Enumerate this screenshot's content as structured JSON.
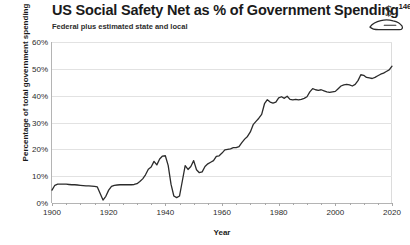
{
  "header": {
    "title": "US Social Safety Net as % of Government Spending",
    "title_superscript": "146",
    "subtitle": "Federal plus estimated state and local",
    "icon": "hand-holding-dollar-icon"
  },
  "colors": {
    "line": "#2b2b2b",
    "gridline": "#e2e2e2",
    "axis": "#b4b4b4",
    "text": "#1a1a1a",
    "background": "#ffffff"
  },
  "chart_data": {
    "type": "line",
    "title": "US Social Safety Net as % of Government Spending",
    "subtitle": "Federal plus estimated state and local",
    "xlabel": "Year",
    "ylabel": "Percentage of total government spending",
    "xlim": [
      1900,
      2020
    ],
    "ylim": [
      0,
      60
    ],
    "y_tick_labels": [
      "0%",
      "10%",
      "20%",
      "30%",
      "40%",
      "50%",
      "60%"
    ],
    "y_ticks": [
      0,
      10,
      20,
      30,
      40,
      50,
      60
    ],
    "x_tick_labels": [
      "1900",
      "1920",
      "1940",
      "1960",
      "1980",
      "2000",
      "2020"
    ],
    "x_ticks": [
      1900,
      1920,
      1940,
      1960,
      1980,
      2000,
      2020
    ],
    "x_minor_tick_step": 5,
    "grid": "horizontal",
    "legend": "none",
    "series": [
      {
        "name": "Social safety net share of government spending",
        "x": [
          1900,
          1901,
          1902,
          1903,
          1904,
          1905,
          1906,
          1907,
          1908,
          1909,
          1910,
          1911,
          1912,
          1913,
          1914,
          1915,
          1916,
          1917,
          1918,
          1919,
          1920,
          1921,
          1922,
          1923,
          1924,
          1925,
          1926,
          1927,
          1928,
          1929,
          1930,
          1931,
          1932,
          1933,
          1934,
          1935,
          1936,
          1937,
          1938,
          1939,
          1940,
          1941,
          1942,
          1943,
          1944,
          1945,
          1946,
          1947,
          1948,
          1949,
          1950,
          1951,
          1952,
          1953,
          1954,
          1955,
          1956,
          1957,
          1958,
          1959,
          1960,
          1961,
          1962,
          1963,
          1964,
          1965,
          1966,
          1967,
          1968,
          1969,
          1970,
          1971,
          1972,
          1973,
          1974,
          1975,
          1976,
          1977,
          1978,
          1979,
          1980,
          1981,
          1982,
          1983,
          1984,
          1985,
          1986,
          1987,
          1988,
          1989,
          1990,
          1991,
          1992,
          1993,
          1994,
          1995,
          1996,
          1997,
          1998,
          1999,
          2000,
          2001,
          2002,
          2003,
          2004,
          2005,
          2006,
          2007,
          2008,
          2009,
          2010,
          2011,
          2012,
          2013,
          2014,
          2015,
          2016,
          2017,
          2018,
          2019,
          2020
        ],
        "y": [
          4.8,
          6.6,
          7.0,
          7.0,
          7.0,
          7.0,
          6.9,
          6.8,
          6.8,
          6.7,
          6.6,
          6.5,
          6.4,
          6.4,
          6.3,
          6.2,
          6.0,
          3.5,
          1.1,
          2.5,
          4.8,
          6.2,
          6.6,
          6.7,
          6.8,
          6.8,
          6.8,
          6.8,
          6.8,
          6.9,
          7.2,
          8.0,
          9.0,
          10.5,
          12.6,
          13.4,
          15.5,
          14.2,
          16.4,
          17.5,
          17.6,
          14.0,
          7.0,
          2.6,
          2.0,
          2.6,
          8.2,
          13.9,
          12.5,
          13.6,
          15.8,
          12.4,
          11.3,
          11.6,
          13.6,
          14.6,
          15.2,
          15.8,
          17.4,
          17.6,
          18.6,
          19.8,
          20.0,
          20.2,
          20.6,
          20.6,
          21.0,
          22.5,
          23.8,
          24.8,
          26.5,
          29.2,
          30.4,
          31.6,
          33.0,
          37.0,
          38.5,
          37.6,
          37.2,
          37.6,
          39.2,
          39.6,
          39.0,
          39.8,
          38.6,
          38.4,
          38.6,
          38.4,
          38.6,
          39.0,
          39.6,
          41.4,
          42.6,
          42.2,
          42.0,
          42.2,
          41.8,
          41.4,
          41.2,
          41.4,
          41.6,
          42.6,
          43.6,
          44.0,
          44.2,
          44.0,
          43.6,
          44.2,
          45.6,
          47.8,
          47.6,
          46.8,
          46.6,
          46.4,
          46.8,
          47.4,
          48.0,
          48.4,
          49.0,
          49.6,
          51.0
        ]
      }
    ]
  }
}
